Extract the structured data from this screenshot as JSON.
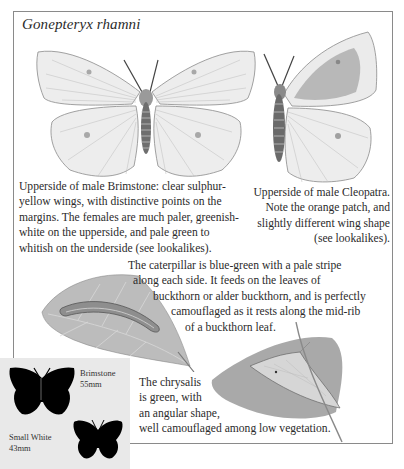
{
  "title": "Gonepteryx rhamni",
  "captions": {
    "brimstone": [
      "Upperside of male Brimstone: clear sulphur-",
      "yellow wings, with distinctive points on the",
      "margins. The females are much paler, greenish-",
      "white on the upperside, and pale green to",
      "whitish on the underside (see lookalikes)."
    ],
    "cleopatra": [
      "Upperside of male Cleopatra.",
      "Note the orange patch, and",
      "slightly different wing shape",
      "(see lookalikes)."
    ],
    "caterpillar": [
      "The caterpillar is blue-green with a pale stripe",
      "along each side. It feeds on the leaves of",
      "buckthorn or alder buckthorn, and is perfectly",
      "camouflaged as it rests along the mid-rib",
      "of a buckthorn leaf."
    ],
    "chrysalis": [
      "The chrysalis",
      "is green, with",
      "an angular shape,",
      "well camouflaged among low vegetation."
    ]
  },
  "size_comparison": {
    "items": [
      {
        "name": "Brimstone",
        "size": "55mm"
      },
      {
        "name": "Small White",
        "size": "43mm"
      }
    ]
  },
  "illustrations": [
    {
      "name": "male-brimstone-upperside"
    },
    {
      "name": "male-cleopatra-upperside"
    },
    {
      "name": "caterpillar-on-leaf"
    },
    {
      "name": "chrysalis-on-leaf"
    }
  ]
}
